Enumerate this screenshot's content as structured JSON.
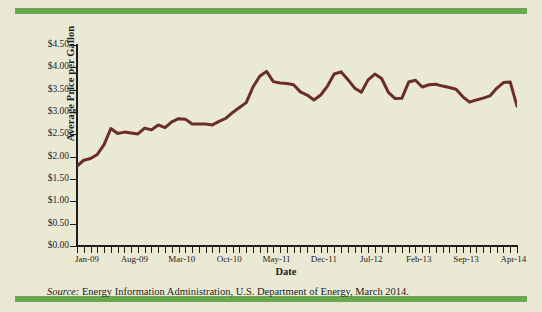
{
  "figure": {
    "background_color": "#e9e8d2",
    "panel_color": "#eae9d4",
    "band_color": "#6aa84f",
    "series_color": "#6b2d2a"
  },
  "axes": {
    "y_axis_title": "Average Price per Gallon",
    "x_axis_title": "Date",
    "y_tick_labels": [
      "$4.50",
      "$4.00",
      "$3.50",
      "$3.00",
      "$2.50",
      "$2.00",
      "$1.50",
      "$1.00",
      "$0.50",
      "$0.00"
    ],
    "x_tick_labels": [
      "Jan-09",
      "Aug-09",
      "Mar-10",
      "Oct-10",
      "May-11",
      "Dec-11",
      "Jul-12",
      "Feb-13",
      "Sep-13",
      "Apr-14"
    ]
  },
  "source": {
    "label": "Source:",
    "text": " Energy Information Administration, U.S. Department of Energy, March 2014."
  },
  "chart_data": {
    "type": "line",
    "title": "",
    "subtitle": "",
    "xlabel": "Date",
    "ylabel": "Average Price per Gallon",
    "ylim": [
      0.0,
      4.5
    ],
    "ytick_step": 0.5,
    "grid": false,
    "legend_position": "none",
    "line_color": "#6b2d2a",
    "line_width_px": 3,
    "x_tick_interval_months": 7,
    "x_tick_labels": [
      "Jan-09",
      "Aug-09",
      "Mar-10",
      "Oct-10",
      "May-11",
      "Dec-11",
      "Jul-12",
      "Feb-13",
      "Sep-13",
      "Apr-14"
    ],
    "x_start": "Jan-09",
    "x_end": "Jun-14",
    "n_points": 66,
    "series": [
      {
        "name": "Average retail gasoline price (US, $/gallon)",
        "x": [
          "Jan-09",
          "Feb-09",
          "Mar-09",
          "Apr-09",
          "May-09",
          "Jun-09",
          "Jul-09",
          "Aug-09",
          "Sep-09",
          "Oct-09",
          "Nov-09",
          "Dec-09",
          "Jan-10",
          "Feb-10",
          "Mar-10",
          "Apr-10",
          "May-10",
          "Jun-10",
          "Jul-10",
          "Aug-10",
          "Sep-10",
          "Oct-10",
          "Nov-10",
          "Dec-10",
          "Jan-11",
          "Feb-11",
          "Mar-11",
          "Apr-11",
          "May-11",
          "Jun-11",
          "Jul-11",
          "Aug-11",
          "Sep-11",
          "Oct-11",
          "Nov-11",
          "Dec-11",
          "Jan-12",
          "Feb-12",
          "Mar-12",
          "Apr-12",
          "May-12",
          "Jun-12",
          "Jul-12",
          "Aug-12",
          "Sep-12",
          "Oct-12",
          "Nov-12",
          "Dec-12",
          "Jan-13",
          "Feb-13",
          "Mar-13",
          "Apr-13",
          "May-13",
          "Jun-13",
          "Jul-13",
          "Aug-13",
          "Sep-13",
          "Oct-13",
          "Nov-13",
          "Dec-13",
          "Jan-14",
          "Feb-14",
          "Mar-14",
          "Apr-14",
          "May-14",
          "Jun-14"
        ],
        "values": [
          1.79,
          1.92,
          1.96,
          2.05,
          2.27,
          2.63,
          2.52,
          2.55,
          2.53,
          2.51,
          2.64,
          2.6,
          2.71,
          2.65,
          2.78,
          2.85,
          2.84,
          2.73,
          2.73,
          2.73,
          2.71,
          2.79,
          2.86,
          2.99,
          3.1,
          3.21,
          3.56,
          3.8,
          3.91,
          3.68,
          3.65,
          3.64,
          3.61,
          3.45,
          3.38,
          3.27,
          3.38,
          3.58,
          3.85,
          3.9,
          3.73,
          3.54,
          3.44,
          3.72,
          3.85,
          3.75,
          3.44,
          3.3,
          3.31,
          3.67,
          3.71,
          3.56,
          3.61,
          3.62,
          3.58,
          3.55,
          3.51,
          3.34,
          3.22,
          3.27,
          3.31,
          3.36,
          3.53,
          3.66,
          3.67,
          3.13
        ]
      }
    ]
  }
}
